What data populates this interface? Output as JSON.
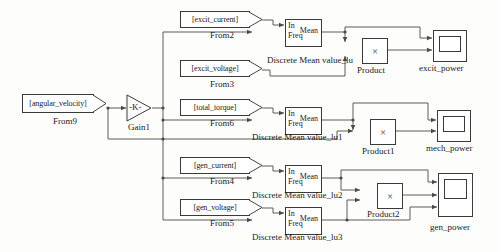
{
  "diagram": {
    "wire_color": "#4a4a4a",
    "block_border_color": "#3a3a3a",
    "background": "#fdfdfc"
  },
  "blocks": {
    "from9": {
      "tag": "[angular_velocity]",
      "name": "From9",
      "type": "from"
    },
    "from2": {
      "tag": "[excit_current]",
      "name": "From2",
      "type": "from"
    },
    "from3": {
      "tag": "[excit_voltage]",
      "name": "From3",
      "type": "from"
    },
    "from6": {
      "tag": "[total_torque]",
      "name": "From6",
      "type": "from"
    },
    "from4": {
      "tag": "[gen_current]",
      "name": "From4",
      "type": "from"
    },
    "from5": {
      "tag": "[gen_voltage]",
      "name": "From5",
      "type": "from"
    },
    "gain1": {
      "value": "-K-",
      "name": "Gain1",
      "type": "gain"
    },
    "mean_lu": {
      "in": "In",
      "freq": "Freq",
      "out": "Mean",
      "name": "Discrete Mean value_lu",
      "type": "mean"
    },
    "mean_lu1": {
      "in": "In",
      "freq": "Freq",
      "out": "Mean",
      "name": "Discrete Mean value_lu1",
      "type": "mean"
    },
    "mean_lu2": {
      "in": "In",
      "freq": "Freq",
      "out": "Mean",
      "name": "Discrete Mean value_lu2",
      "type": "mean"
    },
    "mean_lu3": {
      "in": "In",
      "freq": "Freq",
      "out": "Mean",
      "name": "Discrete Mean value_lu3",
      "type": "mean"
    },
    "product": {
      "symbol": "×",
      "name": "Product",
      "type": "product"
    },
    "product1": {
      "symbol": "×",
      "name": "Product1",
      "type": "product"
    },
    "product2": {
      "symbol": "×",
      "name": "Product2",
      "type": "product"
    },
    "scope_excit": {
      "name": "excit_power",
      "type": "scope"
    },
    "scope_mech": {
      "name": "mech_power",
      "type": "scope"
    },
    "scope_gen": {
      "name": "gen_power",
      "type": "scope"
    }
  }
}
